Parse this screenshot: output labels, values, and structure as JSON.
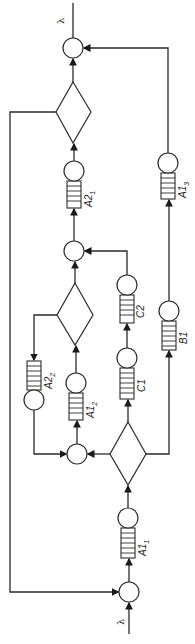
{
  "diagram": {
    "type": "queueing-network",
    "orientation": "rotated-90",
    "input_label": "λ",
    "output_label": "λ",
    "queues": [
      {
        "id": "A1_1",
        "name": "A1",
        "sub": "1"
      },
      {
        "id": "A1_2",
        "name": "A1",
        "sub": "2"
      },
      {
        "id": "A2_2",
        "name": "A2",
        "sub": "2"
      },
      {
        "id": "C1",
        "name": "C1",
        "sub": ""
      },
      {
        "id": "C2",
        "name": "C2",
        "sub": ""
      },
      {
        "id": "B1",
        "name": "B1",
        "sub": ""
      },
      {
        "id": "A2_1",
        "name": "A2",
        "sub": "1"
      },
      {
        "id": "A1_3",
        "name": "A1",
        "sub": "3"
      }
    ],
    "decisions": [
      "bottom-diamond",
      "middle-diamond",
      "top-diamond"
    ],
    "junctions": [
      "input-junction",
      "lower-merge",
      "upper-merge",
      "output-junction"
    ]
  }
}
